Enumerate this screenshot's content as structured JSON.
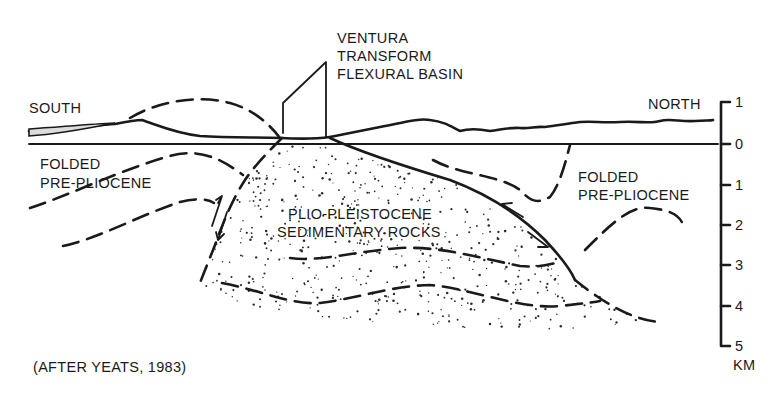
{
  "diagram": {
    "type": "geologic-cross-section",
    "title_lines": [
      "VENTURA",
      "TRANSFORM",
      "FLEXURAL BASIN"
    ],
    "orientation": {
      "left": "SOUTH",
      "right": "NORTH"
    },
    "units": {
      "folded_left": [
        "FOLDED",
        "PRE-PLIOCENE"
      ],
      "folded_right": [
        "FOLDED",
        "PRE-PLIOCENE"
      ],
      "basin_fill": [
        "PLIO-PLEISTOCENE",
        "SEDIMENTARY ROCKS"
      ]
    },
    "scale": {
      "ticks": [
        "1",
        "0",
        "1",
        "2",
        "3",
        "4",
        "5"
      ],
      "unit": "KM"
    },
    "citation": "(AFTER YEATS, 1983)",
    "colors": {
      "ink": "#1a1a1a",
      "background": "#ffffff"
    }
  }
}
